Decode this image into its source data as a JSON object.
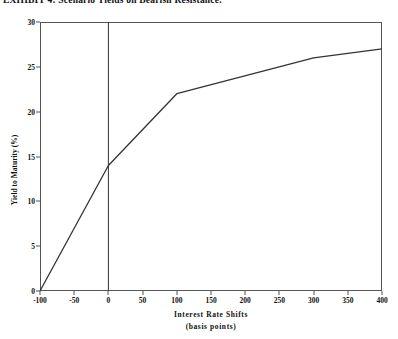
{
  "chart_data": {
    "type": "line",
    "title": "EXHIBIT 4: Scenario Yields on Bearish Resistance.",
    "xlabel": "Interest Rate Shifts",
    "xlabel_sub": "(basis points)",
    "ylabel": "Yield to Maturity (%)",
    "xlim": [
      -100,
      400
    ],
    "ylim": [
      0,
      30
    ],
    "xticks": [
      -100,
      -50,
      0,
      50,
      100,
      150,
      200,
      250,
      300,
      350,
      400
    ],
    "xtick_labels": [
      "-100",
      "-50",
      "0",
      "50",
      "100",
      "150",
      "200",
      "250",
      "300",
      "350",
      "400"
    ],
    "yticks": [
      0,
      5,
      10,
      15,
      20,
      25,
      30
    ],
    "ytick_labels": [
      "0",
      "5",
      "10",
      "15",
      "20",
      "25",
      "30"
    ],
    "grid": false,
    "legend": false,
    "reference_lines": [
      {
        "axis": "x",
        "value": 0,
        "color": "#333333"
      }
    ],
    "series": [
      {
        "name": "Scenario Yield",
        "color": "#333333",
        "x": [
          -100,
          0,
          100,
          300,
          400
        ],
        "y": [
          0,
          14,
          22,
          26,
          27
        ]
      }
    ]
  },
  "colors": {
    "line": "#333333",
    "axis": "#555555",
    "text": "#111111",
    "background": "#ffffff"
  }
}
